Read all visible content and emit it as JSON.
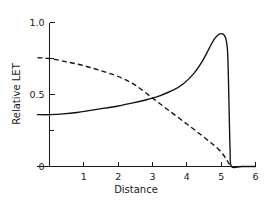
{
  "chart_data": {
    "type": "line",
    "title": "",
    "xlabel": "Distance",
    "ylabel": "Relative LET",
    "xlim": [
      0,
      6
    ],
    "ylim": [
      0,
      1.0
    ],
    "grid": false,
    "legend": "none",
    "x_ticks": [
      "1",
      "2",
      "3",
      "4",
      "5",
      "6"
    ],
    "x_tick_values": [
      1,
      2,
      3,
      4,
      5,
      6
    ],
    "y_ticks": [
      "0",
      "0.5",
      "1.0"
    ],
    "y_tick_values": [
      0,
      0.5,
      1.0
    ],
    "y_minor_tick_values": [
      0.25,
      0.75
    ],
    "x_axis_start": -0.35,
    "series": [
      {
        "name": "Bragg peak curve",
        "style": "solid",
        "color": "#111111",
        "x": [
          -0.35,
          0.0,
          0.4,
          0.8,
          1.2,
          1.6,
          2.0,
          2.4,
          2.8,
          3.0,
          3.2,
          3.6,
          3.9,
          4.2,
          4.45,
          4.65,
          4.8,
          4.92,
          5.0,
          5.08,
          5.14,
          5.18,
          5.2,
          5.22,
          5.24,
          5.26,
          5.3,
          5.6,
          6.0
        ],
        "y": [
          0.36,
          0.36,
          0.365,
          0.375,
          0.39,
          0.405,
          0.42,
          0.44,
          0.462,
          0.475,
          0.49,
          0.53,
          0.575,
          0.645,
          0.73,
          0.82,
          0.885,
          0.915,
          0.923,
          0.915,
          0.885,
          0.82,
          0.72,
          0.52,
          0.3,
          0.12,
          0.0,
          0.0,
          0.0
        ]
      },
      {
        "name": "Energy / fluence curve",
        "style": "dashed",
        "color": "#111111",
        "x": [
          -0.35,
          0.0,
          0.5,
          1.0,
          1.5,
          2.0,
          2.5,
          3.0,
          3.5,
          4.0,
          4.4,
          4.7,
          4.9,
          5.05,
          5.15,
          5.22,
          5.28
        ],
        "y": [
          0.755,
          0.75,
          0.727,
          0.7,
          0.665,
          0.625,
          0.565,
          0.475,
          0.385,
          0.295,
          0.222,
          0.165,
          0.125,
          0.085,
          0.05,
          0.022,
          0.0
        ]
      }
    ]
  },
  "axes": {
    "y_axis_title": "Relative LET",
    "x_axis_title": "Distance"
  }
}
